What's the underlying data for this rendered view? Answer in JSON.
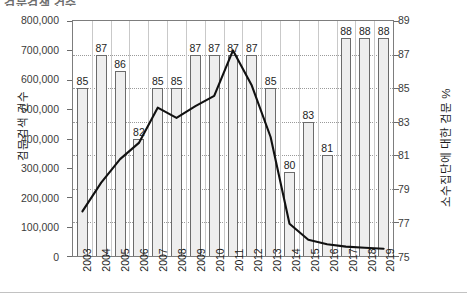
{
  "title": "검문검색 건수",
  "chart_data": {
    "type": "bar",
    "xlabel": "",
    "ylabel": "검문검색 건수",
    "y2label": "소수집단에 대한 검문 %",
    "ylim": [
      0,
      800000
    ],
    "y2lim": [
      75,
      89
    ],
    "grid": true,
    "legend": "none",
    "categories": [
      "2003",
      "2004",
      "2005",
      "2006",
      "2007",
      "2008",
      "2009",
      "2010",
      "2011",
      "2012",
      "2013",
      "2014",
      "2015",
      "2016",
      "2017",
      "2018",
      "2019"
    ],
    "yticks": [
      "0",
      "100,000",
      "200,000",
      "300,000",
      "400,000",
      "500,000",
      "600,000",
      "700,000",
      "800,000"
    ],
    "y2ticks": [
      "75",
      "77",
      "79",
      "81",
      "83",
      "85",
      "87",
      "89"
    ],
    "series": [
      {
        "name": "소수집단에 대한 검문 %",
        "type": "bar",
        "axis": "right",
        "values": [
          85,
          87,
          86,
          82,
          85,
          85,
          87,
          87,
          87,
          87,
          85,
          80,
          83,
          81,
          88,
          88,
          88
        ],
        "labels": [
          "85",
          "87",
          "86",
          "82",
          "85",
          "85",
          "87",
          "87",
          "87",
          "87",
          "85",
          "80",
          "83",
          "81",
          "88",
          "88",
          "88"
        ]
      },
      {
        "name": "검문검색 건수",
        "type": "line",
        "axis": "left",
        "values": [
          152000,
          250000,
          330000,
          385000,
          505000,
          470000,
          510000,
          545000,
          700000,
          580000,
          405000,
          110000,
          55000,
          40000,
          32000,
          28000,
          25000
        ]
      }
    ]
  }
}
